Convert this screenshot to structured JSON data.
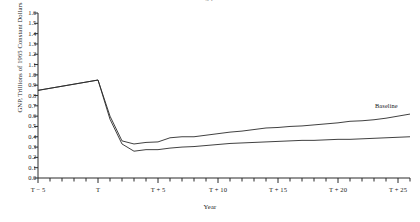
{
  "caption": {
    "clipped_text": "g       p"
  },
  "axes": {
    "ylabel": "GNP, Trillions of 1965 Constant Dollars",
    "xlabel": "Year",
    "ytick_labels": [
      "0.0",
      "0.1",
      "0.2",
      "0.3",
      "0.4",
      "0.5",
      "0.6",
      "0.7",
      "0.8",
      "0.9",
      "1.0",
      "1.1",
      "1.2",
      "1.3",
      "1.4",
      "1.5",
      "1.6"
    ],
    "xtick_labels": [
      "T − 5",
      "T",
      "T + 5",
      "T + 10",
      "T + 15",
      "T + 20",
      "T + 25"
    ]
  },
  "series_labels": {
    "baseline": "Baseline"
  },
  "chart_data": {
    "type": "line",
    "title": "",
    "xlabel": "Year",
    "ylabel": "GNP, Trillions of 1965 Constant Dollars",
    "ylim": [
      0.0,
      1.6
    ],
    "xlim": [
      -5,
      26
    ],
    "ytick_step": 0.1,
    "xtick_step": 1,
    "xtick_major": [
      -5,
      0,
      5,
      10,
      15,
      20,
      25
    ],
    "grid": false,
    "legend": "inline-right",
    "x": [
      -5,
      -4,
      -3,
      -2,
      -1,
      0,
      1,
      2,
      3,
      4,
      5,
      6,
      7,
      8,
      9,
      10,
      11,
      12,
      13,
      14,
      15,
      16,
      17,
      18,
      19,
      20,
      21,
      22,
      23,
      24,
      25,
      26
    ],
    "series": [
      {
        "name": "Baseline",
        "values": [
          0.85,
          0.87,
          0.89,
          0.91,
          0.93,
          0.95,
          0.6,
          0.36,
          0.33,
          0.345,
          0.35,
          0.39,
          0.4,
          0.4,
          0.415,
          0.43,
          0.445,
          0.455,
          0.47,
          0.485,
          0.49,
          0.5,
          0.505,
          0.515,
          0.525,
          0.535,
          0.55,
          0.555,
          0.565,
          0.58,
          0.6,
          0.62
        ]
      },
      {
        "name": "Lower case",
        "values": [
          0.85,
          0.87,
          0.89,
          0.91,
          0.93,
          0.95,
          0.57,
          0.33,
          0.26,
          0.275,
          0.275,
          0.29,
          0.3,
          0.305,
          0.315,
          0.325,
          0.335,
          0.34,
          0.345,
          0.35,
          0.355,
          0.36,
          0.365,
          0.365,
          0.37,
          0.375,
          0.375,
          0.38,
          0.385,
          0.39,
          0.395,
          0.4
        ]
      }
    ]
  }
}
